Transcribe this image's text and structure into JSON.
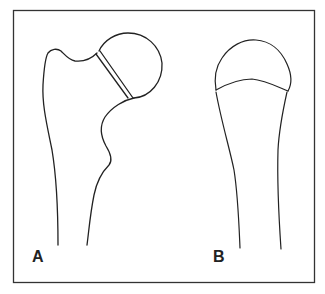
{
  "figure": {
    "panels": [
      {
        "id": "A",
        "label": "A",
        "subject": "proximal-femur-with-epiphysis-displacement"
      },
      {
        "id": "B",
        "label": "B",
        "subject": "proximal-bone-with-capped-epiphysis"
      }
    ],
    "colors": {
      "stroke": "#222222",
      "frame": "#333333",
      "background": "#ffffff"
    }
  }
}
